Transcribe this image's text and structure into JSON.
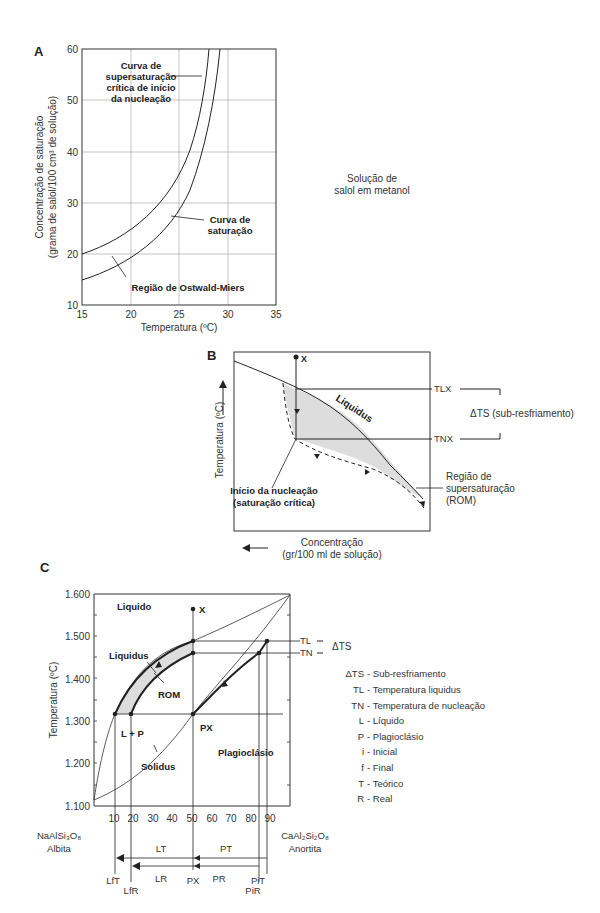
{
  "panelA": {
    "label": "A",
    "ylabel1": "Concentração de saturação",
    "ylabel2": "(grama de salol/100 cm³ de solução)",
    "xlabel": "Temperatura (ºC)",
    "xticks": [
      "15",
      "20",
      "25",
      "30",
      "35"
    ],
    "yticks": [
      "10",
      "20",
      "30",
      "40",
      "50",
      "60"
    ],
    "annot_super": [
      "Curva de",
      "supersaturação",
      "crítica de início",
      "da nucleação"
    ],
    "annot_sat": [
      "Curva de",
      "saturação"
    ],
    "annot_ostwald": "Região de Ostwald-Miers",
    "side_note": [
      "Solução de",
      "salol em metanol"
    ]
  },
  "panelB": {
    "label": "B",
    "ylabel": "Temperatura (ºC)",
    "xlabel": [
      "Concentração",
      "(gr/100 ml de solução)"
    ],
    "point_x": "X",
    "liquidus": "Liquidus",
    "tlx": "TLX",
    "tnx": "TNX",
    "delta": "ΔTS (sub-resfriamento)",
    "nucleation": [
      "Início da nucleação",
      "(saturação crítica)"
    ],
    "region": [
      "Região de",
      "supersaturação",
      "(ROM)"
    ]
  },
  "panelC": {
    "label": "C",
    "ylabel": "Temperatura (ºC)",
    "yticks": [
      "1.600",
      "1.500",
      "1.400",
      "1.300",
      "1.200",
      "1.100"
    ],
    "xticks": [
      "10",
      "20",
      "30",
      "40",
      "50",
      "60",
      "70",
      "80",
      "90"
    ],
    "regions": {
      "liquido": "Liquido",
      "liquidus": "Liquidus",
      "rom": "ROM",
      "lp": "L + P",
      "px": "PX",
      "solidus": "Solidus",
      "plagio": "Plagioclásio",
      "x": "X"
    },
    "tl": "TL",
    "tn": "TN",
    "delta": "ΔTS",
    "left_end": [
      "NaAlSi₃O₈",
      "Albita"
    ],
    "right_end": [
      "CaAl₂Si₂O₈",
      "Anortita"
    ],
    "bottom_labels": {
      "lt": "LT",
      "pt": "PT",
      "lr": "LR",
      "pr": "PR",
      "lft": "LfT",
      "lfr": "LfR",
      "px": "PX",
      "pir": "PiR",
      "pit": "PiT"
    },
    "legend": [
      {
        "sym": "ΔTS",
        "desc": "- Sub-resfriamento"
      },
      {
        "sym": "TL",
        "desc": "- Temperatura liquidus"
      },
      {
        "sym": "TN",
        "desc": "- Temperatura de nucleação"
      },
      {
        "sym": "L",
        "desc": "- Líquido"
      },
      {
        "sym": "P",
        "desc": "- Plagioclásio"
      },
      {
        "sym": "i",
        "desc": "- Inicial"
      },
      {
        "sym": "f",
        "desc": "- Final"
      },
      {
        "sym": "T",
        "desc": "- Teórico"
      },
      {
        "sym": "R",
        "desc": "- Real"
      }
    ]
  }
}
